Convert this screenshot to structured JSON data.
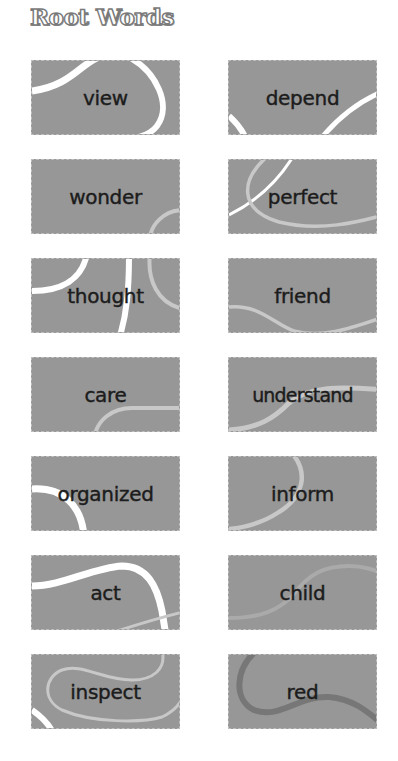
{
  "header": {
    "title": "Root Words"
  },
  "colors": {
    "card_fill": "#979797",
    "card_border": "#bdbdbd",
    "text": "#1c1c1c",
    "swirl_white": "#ffffff",
    "swirl_light": "#c8c8c8",
    "swirl_dark": "#777777"
  },
  "cards": [
    {
      "word": "view",
      "column": "left",
      "row": 1
    },
    {
      "word": "depend",
      "column": "right",
      "row": 1
    },
    {
      "word": "wonder",
      "column": "left",
      "row": 2
    },
    {
      "word": "perfect",
      "column": "right",
      "row": 2
    },
    {
      "word": "thought",
      "column": "left",
      "row": 3
    },
    {
      "word": "friend",
      "column": "right",
      "row": 3
    },
    {
      "word": "care",
      "column": "left",
      "row": 4
    },
    {
      "word": "understand",
      "column": "right",
      "row": 4
    },
    {
      "word": "organized",
      "column": "left",
      "row": 5
    },
    {
      "word": "inform",
      "column": "right",
      "row": 5
    },
    {
      "word": "act",
      "column": "left",
      "row": 6
    },
    {
      "word": "child",
      "column": "right",
      "row": 6
    },
    {
      "word": "inspect",
      "column": "left",
      "row": 7
    },
    {
      "word": "red",
      "column": "right",
      "row": 7
    }
  ]
}
